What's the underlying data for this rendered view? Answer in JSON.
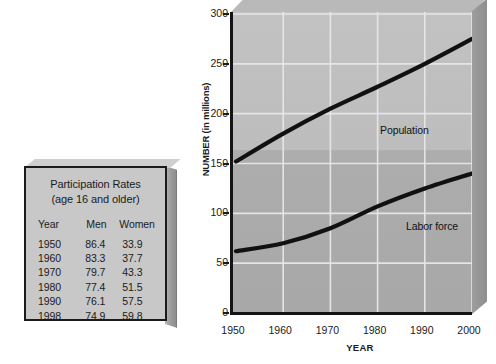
{
  "table_card": {
    "title_line1": "Participation Rates",
    "title_line2": "(age 16 and older)",
    "columns": [
      "Year",
      "Men",
      "Women"
    ],
    "rows": [
      {
        "year": "1950",
        "men": "86.4",
        "women": "33.9"
      },
      {
        "year": "1960",
        "men": "83.3",
        "women": "37.7"
      },
      {
        "year": "1970",
        "men": "79.7",
        "women": "43.3"
      },
      {
        "year": "1980",
        "men": "77.4",
        "women": "51.5"
      },
      {
        "year": "1990",
        "men": "76.1",
        "women": "57.5"
      },
      {
        "year": "1998",
        "men": "74.9",
        "women": "59.8"
      }
    ]
  },
  "chart_data": {
    "type": "line",
    "title": "",
    "xlabel": "YEAR",
    "ylabel": "NUMBER (in millions)",
    "x": [
      1950,
      1960,
      1970,
      1980,
      1990,
      2000
    ],
    "xlim": [
      1950,
      2000
    ],
    "ylim": [
      0,
      300
    ],
    "yticks": [
      0,
      50,
      100,
      150,
      200,
      250,
      300
    ],
    "xticks": [
      "1950",
      "1960",
      "1970",
      "1980",
      "1990",
      "2000"
    ],
    "grid": true,
    "legend": "inline-annotations",
    "series": [
      {
        "name": "Population",
        "values": [
          152,
          180,
          205,
          227,
          250,
          275
        ],
        "color": "#111111"
      },
      {
        "name": "Labor force",
        "values": [
          62,
          70,
          85,
          107,
          125,
          140
        ],
        "color": "#111111"
      }
    ]
  },
  "colors": {
    "plot_background_upper": "#bdbdbd",
    "plot_background_lower": "#a8a8a8",
    "axis": "#141414",
    "gridline": "#e8e8e8",
    "card_face": "#c8c8c8",
    "card_border": "#1b1b1b"
  }
}
